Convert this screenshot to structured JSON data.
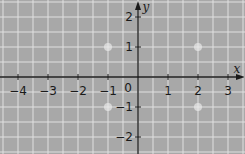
{
  "diagram": {
    "type": "coordinate-grid",
    "background_color": "#a8a8a8",
    "grid_color": "#e0e0e0",
    "axis_color": "#1a1a1a",
    "x_axis": {
      "label": "x",
      "min": -4.5,
      "max": 3.5,
      "ticks": [
        -4,
        -3,
        -2,
        -1,
        1,
        2,
        3
      ],
      "tick_labels": [
        "−4",
        "−3",
        "−2",
        "−1",
        "1",
        "2",
        "3"
      ]
    },
    "y_axis": {
      "label": "y",
      "min": -2.5,
      "max": 2.5,
      "ticks": [
        -2,
        -1,
        1,
        2
      ],
      "tick_labels": [
        "−2",
        "−1",
        "1",
        "2"
      ]
    },
    "origin_label": "0",
    "grid_subdivisions": 2,
    "marked_points": [
      {
        "x": -1,
        "y": 1
      },
      {
        "x": 2,
        "y": 1
      },
      {
        "x": -1,
        "y": -1
      },
      {
        "x": 2,
        "y": -1
      }
    ]
  }
}
